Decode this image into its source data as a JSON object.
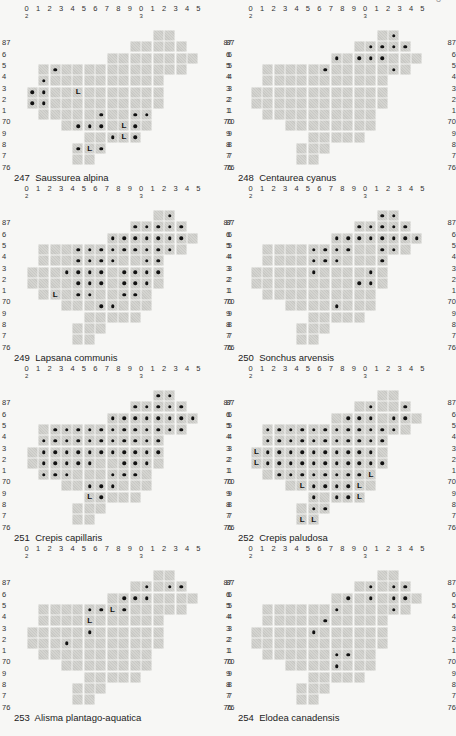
{
  "page": {
    "page_number_fragment": "3",
    "col_labels": [
      {
        "t": "0",
        "sub": "2"
      },
      {
        "t": "1"
      },
      {
        "t": "2"
      },
      {
        "t": "3"
      },
      {
        "t": "4"
      },
      {
        "t": "5"
      },
      {
        "t": "6"
      },
      {
        "t": "7"
      },
      {
        "t": "8"
      },
      {
        "t": "9"
      },
      {
        "t": "0",
        "sub": "3"
      },
      {
        "t": "1"
      },
      {
        "t": "2"
      },
      {
        "t": "3"
      },
      {
        "t": "4"
      },
      {
        "t": "5"
      }
    ],
    "row_labels": [
      "87",
      "6",
      "5",
      "4",
      "3",
      "2",
      "1",
      "70",
      "9",
      "8",
      "7",
      "76"
    ],
    "grid_mask": [
      [
        11,
        12
      ],
      [
        9,
        10,
        11,
        12,
        13
      ],
      [
        7,
        8,
        9,
        10,
        11,
        12,
        13,
        14
      ],
      [
        1,
        2,
        3,
        4,
        5,
        6,
        7,
        8,
        9,
        10,
        11,
        12,
        13
      ],
      [
        1,
        2,
        3,
        4,
        5,
        6,
        7,
        8,
        9,
        10,
        11
      ],
      [
        0,
        1,
        2,
        3,
        4,
        5,
        6,
        7,
        8,
        9,
        10,
        11
      ],
      [
        0,
        1,
        2,
        3,
        4,
        5,
        6,
        7,
        8,
        9,
        10,
        11
      ],
      [
        1,
        2,
        3,
        4,
        5,
        6,
        7,
        8,
        9,
        10
      ],
      [
        3,
        4,
        5,
        6,
        7,
        8,
        9,
        10
      ],
      [
        5,
        6,
        7,
        8,
        9
      ],
      [
        4,
        5,
        6
      ],
      [
        4,
        5
      ]
    ],
    "legend_marks": {
      "dot": "record present",
      "L": "literature record"
    }
  },
  "maps": [
    {
      "number": "247",
      "species": "Saussurea alpina",
      "dots": [
        [
          3,
          2
        ],
        [
          4,
          1
        ],
        [
          5,
          0
        ],
        [
          5,
          1
        ],
        [
          6,
          0
        ],
        [
          6,
          1
        ],
        [
          7,
          6
        ],
        [
          7,
          9
        ],
        [
          7,
          10
        ],
        [
          8,
          4
        ],
        [
          8,
          5
        ],
        [
          8,
          6
        ],
        [
          8,
          9
        ],
        [
          9,
          7
        ],
        [
          9,
          9
        ],
        [
          10,
          4
        ],
        [
          10,
          6
        ]
      ],
      "L": [
        [
          5,
          4
        ],
        [
          8,
          8
        ],
        [
          9,
          8
        ],
        [
          10,
          5
        ]
      ]
    },
    {
      "number": "248",
      "species": "Centaurea cyanus",
      "dots": [
        [
          0,
          12
        ],
        [
          1,
          10
        ],
        [
          1,
          11
        ],
        [
          1,
          12
        ],
        [
          1,
          13
        ],
        [
          2,
          7
        ],
        [
          2,
          9
        ],
        [
          2,
          10
        ],
        [
          2,
          11
        ],
        [
          3,
          6
        ],
        [
          3,
          12
        ]
      ],
      "L": []
    },
    {
      "number": "249",
      "species": "Lapsana communis",
      "dots": [
        [
          0,
          12
        ],
        [
          1,
          9
        ],
        [
          1,
          10
        ],
        [
          1,
          11
        ],
        [
          1,
          12
        ],
        [
          1,
          13
        ],
        [
          2,
          7
        ],
        [
          2,
          8
        ],
        [
          2,
          9
        ],
        [
          2,
          10
        ],
        [
          2,
          11
        ],
        [
          2,
          12
        ],
        [
          2,
          13
        ],
        [
          3,
          4
        ],
        [
          3,
          5
        ],
        [
          3,
          6
        ],
        [
          3,
          7
        ],
        [
          3,
          8
        ],
        [
          3,
          9
        ],
        [
          3,
          10
        ],
        [
          3,
          11
        ],
        [
          3,
          12
        ],
        [
          4,
          4
        ],
        [
          4,
          5
        ],
        [
          4,
          6
        ],
        [
          4,
          7
        ],
        [
          4,
          10
        ],
        [
          4,
          11
        ],
        [
          5,
          3
        ],
        [
          5,
          4
        ],
        [
          5,
          5
        ],
        [
          5,
          6
        ],
        [
          5,
          8
        ],
        [
          5,
          9
        ],
        [
          5,
          10
        ],
        [
          5,
          11
        ],
        [
          6,
          4
        ],
        [
          6,
          5
        ],
        [
          6,
          6
        ],
        [
          6,
          8
        ],
        [
          6,
          9
        ],
        [
          6,
          10
        ],
        [
          7,
          4
        ],
        [
          7,
          5
        ],
        [
          7,
          8
        ],
        [
          7,
          9
        ],
        [
          8,
          6
        ],
        [
          8,
          7
        ]
      ],
      "L": [
        [
          7,
          2
        ]
      ]
    },
    {
      "number": "250",
      "species": "Sonchus arvensis",
      "dots": [
        [
          0,
          11
        ],
        [
          0,
          12
        ],
        [
          1,
          9
        ],
        [
          1,
          10
        ],
        [
          1,
          11
        ],
        [
          1,
          12
        ],
        [
          1,
          13
        ],
        [
          2,
          7
        ],
        [
          2,
          8
        ],
        [
          2,
          9
        ],
        [
          2,
          10
        ],
        [
          2,
          11
        ],
        [
          2,
          12
        ],
        [
          2,
          13
        ],
        [
          2,
          14
        ],
        [
          3,
          5
        ],
        [
          3,
          6
        ],
        [
          3,
          7
        ],
        [
          3,
          8
        ],
        [
          3,
          11
        ],
        [
          3,
          12
        ],
        [
          4,
          5
        ],
        [
          4,
          6
        ],
        [
          4,
          7
        ],
        [
          4,
          11
        ],
        [
          5,
          5
        ],
        [
          5,
          10
        ],
        [
          6,
          9
        ],
        [
          6,
          10
        ],
        [
          8,
          7
        ]
      ],
      "L": []
    },
    {
      "number": "251",
      "species": "Crepis capillaris",
      "dots": [
        [
          0,
          11
        ],
        [
          0,
          12
        ],
        [
          1,
          9
        ],
        [
          1,
          10
        ],
        [
          1,
          11
        ],
        [
          1,
          12
        ],
        [
          1,
          13
        ],
        [
          2,
          7
        ],
        [
          2,
          8
        ],
        [
          2,
          9
        ],
        [
          2,
          10
        ],
        [
          2,
          11
        ],
        [
          2,
          12
        ],
        [
          2,
          13
        ],
        [
          2,
          14
        ],
        [
          3,
          2
        ],
        [
          3,
          3
        ],
        [
          3,
          4
        ],
        [
          3,
          5
        ],
        [
          3,
          6
        ],
        [
          3,
          7
        ],
        [
          3,
          8
        ],
        [
          3,
          9
        ],
        [
          3,
          10
        ],
        [
          3,
          11
        ],
        [
          3,
          12
        ],
        [
          3,
          13
        ],
        [
          4,
          1
        ],
        [
          4,
          2
        ],
        [
          4,
          3
        ],
        [
          4,
          4
        ],
        [
          4,
          5
        ],
        [
          4,
          6
        ],
        [
          4,
          7
        ],
        [
          4,
          8
        ],
        [
          4,
          9
        ],
        [
          4,
          10
        ],
        [
          4,
          11
        ],
        [
          5,
          1
        ],
        [
          5,
          2
        ],
        [
          5,
          3
        ],
        [
          5,
          4
        ],
        [
          5,
          5
        ],
        [
          5,
          6
        ],
        [
          5,
          7
        ],
        [
          5,
          8
        ],
        [
          5,
          9
        ],
        [
          5,
          10
        ],
        [
          5,
          11
        ],
        [
          6,
          1
        ],
        [
          6,
          2
        ],
        [
          6,
          3
        ],
        [
          6,
          4
        ],
        [
          6,
          5
        ],
        [
          6,
          8
        ],
        [
          6,
          9
        ],
        [
          6,
          10
        ],
        [
          7,
          1
        ],
        [
          7,
          2
        ],
        [
          7,
          3
        ],
        [
          7,
          7
        ],
        [
          7,
          8
        ],
        [
          7,
          9
        ],
        [
          8,
          5
        ],
        [
          8,
          6
        ],
        [
          8,
          7
        ],
        [
          9,
          6
        ]
      ],
      "L": [
        [
          9,
          5
        ]
      ]
    },
    {
      "number": "252",
      "species": "Crepis paludosa",
      "dots": [
        [
          1,
          10
        ],
        [
          1,
          13
        ],
        [
          2,
          8
        ],
        [
          2,
          9
        ],
        [
          2,
          10
        ],
        [
          2,
          12
        ],
        [
          2,
          13
        ],
        [
          3,
          1
        ],
        [
          3,
          2
        ],
        [
          3,
          3
        ],
        [
          3,
          4
        ],
        [
          3,
          5
        ],
        [
          3,
          6
        ],
        [
          3,
          7
        ],
        [
          3,
          8
        ],
        [
          3,
          9
        ],
        [
          3,
          10
        ],
        [
          3,
          11
        ],
        [
          3,
          12
        ],
        [
          4,
          1
        ],
        [
          4,
          2
        ],
        [
          4,
          3
        ],
        [
          4,
          4
        ],
        [
          4,
          5
        ],
        [
          4,
          6
        ],
        [
          4,
          7
        ],
        [
          4,
          8
        ],
        [
          4,
          9
        ],
        [
          4,
          10
        ],
        [
          4,
          11
        ],
        [
          5,
          1
        ],
        [
          5,
          2
        ],
        [
          5,
          3
        ],
        [
          5,
          4
        ],
        [
          5,
          5
        ],
        [
          5,
          6
        ],
        [
          5,
          7
        ],
        [
          5,
          8
        ],
        [
          5,
          9
        ],
        [
          5,
          10
        ],
        [
          6,
          1
        ],
        [
          6,
          2
        ],
        [
          6,
          3
        ],
        [
          6,
          4
        ],
        [
          6,
          5
        ],
        [
          6,
          6
        ],
        [
          6,
          7
        ],
        [
          6,
          8
        ],
        [
          6,
          9
        ],
        [
          6,
          10
        ],
        [
          6,
          11
        ],
        [
          7,
          2
        ],
        [
          7,
          3
        ],
        [
          7,
          4
        ],
        [
          7,
          5
        ],
        [
          7,
          6
        ],
        [
          7,
          7
        ],
        [
          7,
          8
        ],
        [
          7,
          9
        ],
        [
          8,
          5
        ],
        [
          8,
          6
        ],
        [
          8,
          7
        ],
        [
          8,
          8
        ],
        [
          9,
          5
        ],
        [
          9,
          7
        ],
        [
          9,
          8
        ],
        [
          10,
          5
        ],
        [
          10,
          6
        ]
      ],
      "L": [
        [
          5,
          0
        ],
        [
          6,
          0
        ],
        [
          7,
          10
        ],
        [
          8,
          4
        ],
        [
          8,
          9
        ],
        [
          9,
          9
        ],
        [
          11,
          4
        ],
        [
          11,
          5
        ]
      ]
    },
    {
      "number": "253",
      "species": "Alisma plantago-aquatica",
      "dots": [
        [
          1,
          10
        ],
        [
          1,
          12
        ],
        [
          1,
          13
        ],
        [
          2,
          8
        ],
        [
          2,
          9
        ],
        [
          2,
          10
        ],
        [
          3,
          5
        ],
        [
          3,
          6
        ],
        [
          3,
          8
        ],
        [
          5,
          5
        ],
        [
          6,
          3
        ]
      ],
      "L": [
        [
          3,
          7
        ],
        [
          4,
          5
        ]
      ]
    },
    {
      "number": "254",
      "species": "Elodea canadensis",
      "dots": [
        [
          1,
          10
        ],
        [
          1,
          12
        ],
        [
          1,
          13
        ],
        [
          2,
          8
        ],
        [
          2,
          10
        ],
        [
          2,
          12
        ],
        [
          2,
          13
        ],
        [
          3,
          7
        ],
        [
          3,
          12
        ],
        [
          4,
          6
        ],
        [
          5,
          5
        ],
        [
          7,
          7
        ],
        [
          7,
          8
        ],
        [
          8,
          7
        ]
      ],
      "L": []
    }
  ]
}
